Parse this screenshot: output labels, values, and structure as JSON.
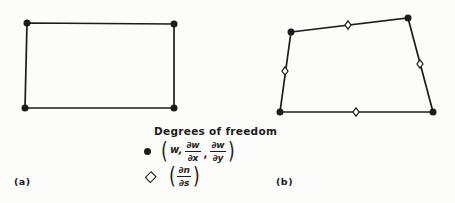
{
  "colors": {
    "background": "#fcfcfa",
    "ink": "#1c1c1c"
  },
  "figure_labels": {
    "a": "(a)",
    "b": "(b)"
  },
  "legend": {
    "title": "Degrees of freedom",
    "entries": [
      {
        "marker": "filled-circle",
        "open_paren": "(",
        "term1": "w,",
        "frac1": {
          "num": "∂w",
          "den": "∂x"
        },
        "comma": ",",
        "frac2": {
          "num": "∂w",
          "den": "∂y"
        },
        "close_paren": ")"
      },
      {
        "marker": "open-diamond",
        "open_paren": "(",
        "frac": {
          "num": "∂n",
          "den": "∂s"
        },
        "close_paren": ")"
      }
    ]
  },
  "geometry": {
    "element_a": {
      "vertices": [
        [
          27,
          23
        ],
        [
          174,
          24
        ],
        [
          174,
          108
        ],
        [
          25,
          108
        ]
      ],
      "midside_markers": []
    },
    "element_b": {
      "vertices": [
        [
          291,
          32
        ],
        [
          408,
          18
        ],
        [
          433,
          112
        ],
        [
          280,
          112
        ]
      ],
      "midside_markers": [
        [
          348,
          25
        ],
        [
          285,
          71
        ],
        [
          420,
          64
        ],
        [
          356,
          112
        ]
      ]
    }
  }
}
